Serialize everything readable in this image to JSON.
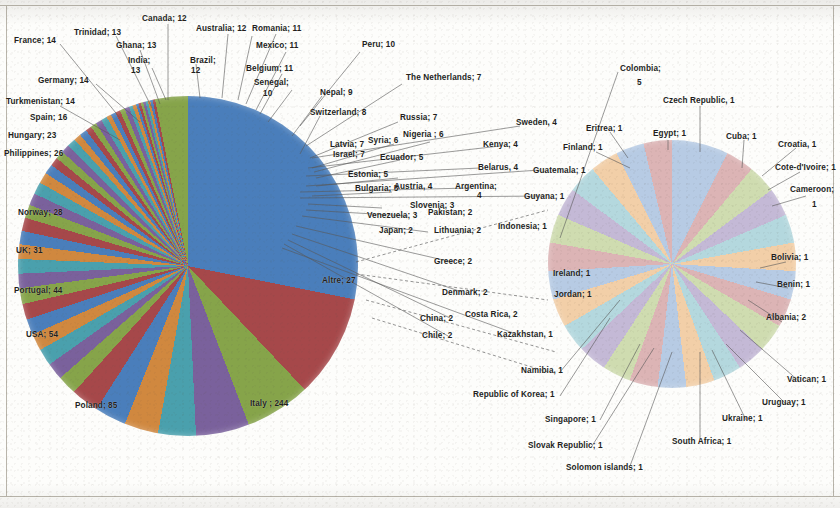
{
  "figure": {
    "type": "pie-pair",
    "note_label": "Altre; 27"
  },
  "chart_data": {
    "type": "pie",
    "title": "",
    "subtitle": "",
    "xlabel": "",
    "ylabel": "",
    "legend_position": "none",
    "grid": false,
    "label_format": "name; value",
    "charts": [
      {
        "name": "main-pie",
        "note": "Large left pie — all countries, largest first",
        "categories": [
          "Italy",
          "Poland",
          "USA",
          "Portugal",
          "UK",
          "Norway",
          "Philippines",
          "Hungary",
          "Spain",
          "Turkmenistan",
          "Germany",
          "France",
          "Trinidad",
          "India",
          "Ghana",
          "Canada",
          "Brazil",
          "Australia",
          "Romania",
          "Mexico",
          "Belgium",
          "Senegal",
          "Peru",
          "Nepal",
          "Switzerland",
          "The Netherlands",
          "Russia",
          "Latvia",
          "Israel",
          "Syria",
          "Nigeria",
          "Ecuador",
          "Estonia",
          "Bulgaria",
          "Colombia",
          "Sweden",
          "Kenya",
          "Belarus",
          "Austria",
          "Argentina",
          "Slovenia",
          "Venezuela",
          "Pakistan",
          "Japan",
          "Lithuania",
          "Greece",
          "Denmark",
          "China",
          "Costa Rica",
          "Chile",
          "Altre"
        ],
        "values": [
          244,
          85,
          54,
          44,
          31,
          28,
          26,
          23,
          16,
          14,
          14,
          14,
          13,
          13,
          13,
          12,
          12,
          12,
          11,
          11,
          11,
          10,
          10,
          9,
          8,
          7,
          7,
          7,
          7,
          6,
          6,
          5,
          5,
          5,
          5,
          4,
          4,
          4,
          4,
          4,
          3,
          3,
          2,
          2,
          2,
          2,
          2,
          2,
          2,
          2,
          27
        ]
      },
      {
        "name": "others-pie",
        "note": "Right exploded detail pie — the 'Altre; 27' group, one slice per country",
        "categories": [
          "Albania",
          "Benin",
          "Bolivia",
          "Cameroon",
          "Cote-d'Ivoire",
          "Croatia",
          "Cuba",
          "Czech Republic",
          "Egypt",
          "Eritrea",
          "Finland",
          "Guatemala",
          "Guyana",
          "Indonesia",
          "Ireland",
          "Jordan",
          "Kazakhstan",
          "Namibia",
          "Republic of Korea",
          "Singapore",
          "Slovak Republic",
          "Solomon Islands",
          "South Africa",
          "Ukraine",
          "Uruguay",
          "Vatican"
        ],
        "values": [
          2,
          1,
          1,
          1,
          1,
          1,
          1,
          1,
          1,
          1,
          1,
          1,
          1,
          1,
          1,
          1,
          1,
          1,
          1,
          1,
          1,
          1,
          1,
          1,
          1,
          1
        ]
      }
    ]
  },
  "main_labels": [
    {
      "text": "France; 14",
      "x": 14,
      "y": 36,
      "align": "left"
    },
    {
      "text": "Trinidad; 13",
      "x": 74,
      "y": 28,
      "align": "left"
    },
    {
      "text": "Canada; 12",
      "x": 142,
      "y": 14,
      "align": "left"
    },
    {
      "text": "Australia; 12",
      "x": 196,
      "y": 24,
      "align": "left"
    },
    {
      "text": "Romania; 11",
      "x": 252,
      "y": 24,
      "align": "left"
    },
    {
      "text": "Ghana; 13",
      "x": 116,
      "y": 41,
      "align": "left"
    },
    {
      "text": "Mexico; 11",
      "x": 256,
      "y": 41,
      "align": "left"
    },
    {
      "text": "Peru; 10",
      "x": 362,
      "y": 40,
      "align": "left"
    },
    {
      "text": "India;",
      "x": 128,
      "y": 56,
      "align": "left"
    },
    {
      "text": "13",
      "x": 131,
      "y": 66,
      "align": "left"
    },
    {
      "text": "Brazil;",
      "x": 190,
      "y": 56,
      "align": "left"
    },
    {
      "text": "12",
      "x": 191,
      "y": 66,
      "align": "left"
    },
    {
      "text": "Belgium; 11",
      "x": 246,
      "y": 64,
      "align": "left"
    },
    {
      "text": "Germany; 14",
      "x": 38,
      "y": 76,
      "align": "left"
    },
    {
      "text": "Senegal;",
      "x": 254,
      "y": 78,
      "align": "left"
    },
    {
      "text": "10",
      "x": 263,
      "y": 89,
      "align": "left"
    },
    {
      "text": "Nepal; 9",
      "x": 320,
      "y": 88,
      "align": "left"
    },
    {
      "text": "The Netherlands; 7",
      "x": 406,
      "y": 73,
      "align": "left"
    },
    {
      "text": "Turkmenistan; 14",
      "x": 6,
      "y": 97,
      "align": "left"
    },
    {
      "text": "Switzerland; 8",
      "x": 310,
      "y": 108,
      "align": "left"
    },
    {
      "text": "Russia; 7",
      "x": 400,
      "y": 113,
      "align": "left"
    },
    {
      "text": "Sweden, 4",
      "x": 516,
      "y": 118,
      "align": "left"
    },
    {
      "text": "Spain; 16",
      "x": 30,
      "y": 113,
      "align": "left"
    },
    {
      "text": "Latvia; 7",
      "x": 330,
      "y": 140,
      "align": "left"
    },
    {
      "text": "Syria; 6",
      "x": 368,
      "y": 136,
      "align": "left"
    },
    {
      "text": "Nigeria ; 6",
      "x": 403,
      "y": 130,
      "align": "left"
    },
    {
      "text": "Kenya; 4",
      "x": 483,
      "y": 140,
      "align": "left"
    },
    {
      "text": "Hungary; 23",
      "x": 8,
      "y": 131,
      "align": "left"
    },
    {
      "text": "Israel; 7",
      "x": 333,
      "y": 150,
      "align": "left"
    },
    {
      "text": "Ecuador; 5",
      "x": 380,
      "y": 153,
      "align": "left"
    },
    {
      "text": "Belarus, 4",
      "x": 478,
      "y": 163,
      "align": "left"
    },
    {
      "text": "Philippines; 26",
      "x": 4,
      "y": 149,
      "align": "left"
    },
    {
      "text": "Estonia; 5",
      "x": 348,
      "y": 170,
      "align": "left"
    },
    {
      "text": "Guatemala; 1",
      "x": 533,
      "y": 166,
      "align": "left"
    },
    {
      "text": "Bulgaria; 5",
      "x": 355,
      "y": 184,
      "align": "left"
    },
    {
      "text": "Austria, 4",
      "x": 394,
      "y": 182,
      "align": "left"
    },
    {
      "text": "Argentina;",
      "x": 455,
      "y": 182,
      "align": "left"
    },
    {
      "text": "4",
      "x": 477,
      "y": 191,
      "align": "left"
    },
    {
      "text": "Guyana; 1",
      "x": 524,
      "y": 192,
      "align": "left"
    },
    {
      "text": "Slovenia; 3",
      "x": 410,
      "y": 201,
      "align": "left"
    },
    {
      "text": "Venezuela; 3",
      "x": 367,
      "y": 211,
      "align": "left"
    },
    {
      "text": "Pakistan; 2",
      "x": 428,
      "y": 208,
      "align": "left"
    },
    {
      "text": "Indonesia; 1",
      "x": 498,
      "y": 222,
      "align": "left"
    },
    {
      "text": "Japan; 2",
      "x": 379,
      "y": 226,
      "align": "left"
    },
    {
      "text": "Lithuania; 2",
      "x": 434,
      "y": 226,
      "align": "left"
    },
    {
      "text": "Norway; 28",
      "x": 18,
      "y": 208,
      "align": "left"
    },
    {
      "text": "Greece; 2",
      "x": 434,
      "y": 257,
      "align": "left"
    },
    {
      "text": "UK; 31",
      "x": 16,
      "y": 246,
      "align": "left"
    },
    {
      "text": "Altre; 27",
      "x": 322,
      "y": 276,
      "align": "left"
    },
    {
      "text": "Denmark; 2",
      "x": 442,
      "y": 288,
      "align": "left"
    },
    {
      "text": "Portugal; 44",
      "x": 14,
      "y": 286,
      "align": "left"
    },
    {
      "text": "China; 2",
      "x": 420,
      "y": 314,
      "align": "left"
    },
    {
      "text": "Costa Rica, 2",
      "x": 465,
      "y": 310,
      "align": "left"
    },
    {
      "text": "Chile; 2",
      "x": 422,
      "y": 331,
      "align": "left"
    },
    {
      "text": "Kazakhstan, 1",
      "x": 497,
      "y": 330,
      "align": "left"
    },
    {
      "text": "USA; 54",
      "x": 26,
      "y": 330,
      "align": "left"
    },
    {
      "text": "Poland; 85",
      "x": 75,
      "y": 401,
      "align": "left"
    },
    {
      "text": "Italy ; 244",
      "x": 250,
      "y": 399,
      "align": "left"
    }
  ],
  "others_labels": [
    {
      "text": "Colombia;",
      "x": 620,
      "y": 64,
      "align": "left"
    },
    {
      "text": "5",
      "x": 637,
      "y": 78,
      "align": "left"
    },
    {
      "text": "Czech Republic, 1",
      "x": 663,
      "y": 96,
      "align": "left"
    },
    {
      "text": "Eritrea; 1",
      "x": 586,
      "y": 124,
      "align": "left"
    },
    {
      "text": "Egypt; 1",
      "x": 653,
      "y": 129,
      "align": "left"
    },
    {
      "text": "Cuba; 1",
      "x": 726,
      "y": 132,
      "align": "left"
    },
    {
      "text": "Croatia, 1",
      "x": 778,
      "y": 140,
      "align": "left"
    },
    {
      "text": "Finland; 1",
      "x": 563,
      "y": 143,
      "align": "left"
    },
    {
      "text": "Cote-d'Ivoire; 1",
      "x": 775,
      "y": 163,
      "align": "left"
    },
    {
      "text": "Cameroon;",
      "x": 790,
      "y": 185,
      "align": "left"
    },
    {
      "text": "1",
      "x": 812,
      "y": 200,
      "align": "left"
    },
    {
      "text": "Ireland; 1",
      "x": 553,
      "y": 269,
      "align": "left"
    },
    {
      "text": "Bolivia; 1",
      "x": 771,
      "y": 253,
      "align": "left"
    },
    {
      "text": "Jordan; 1",
      "x": 554,
      "y": 290,
      "align": "left"
    },
    {
      "text": "Benin; 1",
      "x": 777,
      "y": 280,
      "align": "left"
    },
    {
      "text": "Albania; 2",
      "x": 766,
      "y": 313,
      "align": "left"
    },
    {
      "text": "Vatican; 1",
      "x": 787,
      "y": 375,
      "align": "left"
    },
    {
      "text": "Uruguay; 1",
      "x": 762,
      "y": 398,
      "align": "left"
    },
    {
      "text": "Ukraine; 1",
      "x": 722,
      "y": 414,
      "align": "left"
    },
    {
      "text": "South Africa; 1",
      "x": 672,
      "y": 437,
      "align": "left"
    },
    {
      "text": "Namibia, 1",
      "x": 521,
      "y": 366,
      "align": "left"
    },
    {
      "text": "Republic of Korea; 1",
      "x": 473,
      "y": 390,
      "align": "left"
    },
    {
      "text": "Singapore; 1",
      "x": 545,
      "y": 415,
      "align": "left"
    },
    {
      "text": "Slovak Republic; 1",
      "x": 528,
      "y": 441,
      "align": "left"
    },
    {
      "text": "Solomon islands; 1",
      "x": 566,
      "y": 463,
      "align": "left"
    }
  ],
  "palette": {
    "main": [
      "#4a7ebb",
      "#a6484a",
      "#86a44a",
      "#7a619c",
      "#4aa0ad",
      "#d0883f"
    ],
    "others": [
      "#b7cbe4",
      "#dcb4b5",
      "#cfdcb0",
      "#c4b9d6",
      "#b4d8de",
      "#f2cfa8"
    ],
    "line": "#595959",
    "text": "#231f1c",
    "border": "#b9b5ab"
  }
}
